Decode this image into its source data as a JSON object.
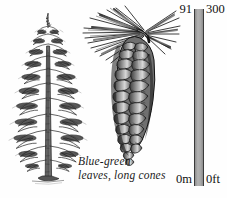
{
  "illustration": {
    "tree": {
      "name": "conifer-tree",
      "description": "Tall conical conifer tree with drooping branches and straight trunk"
    },
    "cone": {
      "name": "pine-cone",
      "description": "Hanging long pine cone with overlapping scales and needle spray at top"
    }
  },
  "caption": {
    "line1": "Blue-green",
    "line2": "leaves, long cones"
  },
  "scale": {
    "top_metric": "91",
    "top_imperial": "300",
    "bottom_metric": "0m",
    "bottom_imperial": "0ft",
    "bar_color": "#a3a3a3",
    "bar_border_color": "#3a3a3a"
  },
  "colors": {
    "background": "#fefefe",
    "ink": "#1a1a1a"
  }
}
